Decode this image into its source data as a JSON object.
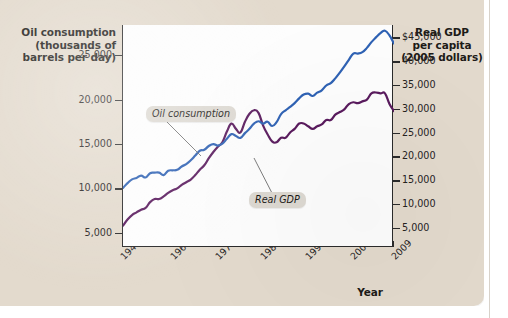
{
  "axis_titles": {
    "left": "Oil consumption\n(thousands of\nbarrels per day)",
    "left_line1": "Oil consumption",
    "left_line2": "(thousands of",
    "left_line3": "barrels per day)",
    "right_line1": "Real GDP",
    "right_line2": "per capita",
    "right_line3": "(2005 dollars)",
    "x": "Year"
  },
  "callouts": {
    "oil": "Oil consumption",
    "gdp": "Real GDP"
  },
  "colors": {
    "oil_line": "#5a1b5e",
    "gdp_line": "#2f62b4",
    "panel_background": "#e3dacd",
    "plot_background": "#fdfdfd",
    "axis": "#2b2b2b",
    "callout_background": "#ddd9d2"
  },
  "chart_data": {
    "type": "line",
    "title": "",
    "subtitle": "",
    "xlabel": "Year",
    "grid": false,
    "legend_position": "inline-callouts",
    "xlim": [
      1949,
      2009
    ],
    "x_ticks": [
      1949,
      1960,
      1970,
      1980,
      1990,
      2000,
      2009
    ],
    "x_tick_labels": [
      "1949",
      "1960",
      "1970",
      "1980",
      "1990",
      "2000",
      "2009"
    ],
    "axes": [
      {
        "id": "left",
        "side": "left",
        "ylabel": "Oil consumption (thousands of barrels per day)",
        "ylim": [
          3400,
          28400
        ],
        "ticks": [
          5000,
          10000,
          15000,
          20000,
          25000
        ],
        "tick_labels": [
          "5,000",
          "10,000",
          "15,000",
          "20,000",
          "25,000"
        ]
      },
      {
        "id": "right",
        "side": "right",
        "ylabel": "Real GDP per capita (2005 dollars)",
        "ylim": [
          1000,
          47600
        ],
        "ticks": [
          5000,
          10000,
          15000,
          20000,
          25000,
          30000,
          35000,
          40000,
          45000
        ],
        "tick_labels": [
          "5,000",
          "10,000",
          "15,000",
          "20,000",
          "25,000",
          "30,000",
          "35,000",
          "40,000",
          "$45,000"
        ]
      }
    ],
    "series": [
      {
        "name": "Oil consumption",
        "axis": "left",
        "color": "#5a1b5e",
        "units": "thousands of barrels per day",
        "x": [
          1949,
          1950,
          1951,
          1952,
          1953,
          1954,
          1955,
          1956,
          1957,
          1958,
          1959,
          1960,
          1961,
          1962,
          1963,
          1964,
          1965,
          1966,
          1967,
          1968,
          1969,
          1970,
          1971,
          1972,
          1973,
          1974,
          1975,
          1976,
          1977,
          1978,
          1979,
          1980,
          1981,
          1982,
          1983,
          1984,
          1985,
          1986,
          1987,
          1988,
          1989,
          1990,
          1991,
          1992,
          1993,
          1994,
          1995,
          1996,
          1997,
          1998,
          1999,
          2000,
          2001,
          2002,
          2003,
          2004,
          2005,
          2006,
          2007,
          2008,
          2009
        ],
        "values": [
          5800,
          6500,
          7000,
          7300,
          7600,
          7800,
          8450,
          8800,
          8800,
          9100,
          9500,
          9800,
          10000,
          10400,
          10700,
          11000,
          11500,
          12100,
          12600,
          13400,
          14100,
          14700,
          15200,
          16400,
          17300,
          16700,
          16300,
          17500,
          18400,
          18800,
          18500,
          17100,
          16100,
          15300,
          15200,
          15700,
          15700,
          16300,
          16700,
          17300,
          17300,
          17000,
          16700,
          17000,
          17200,
          17700,
          17700,
          18300,
          18600,
          18900,
          19500,
          19700,
          19600,
          19800,
          20000,
          20700,
          20800,
          20700,
          20700,
          19500,
          18700
        ]
      },
      {
        "name": "Real GDP",
        "axis": "right",
        "color": "#2f62b4",
        "units": "2005 dollars per capita",
        "x": [
          1949,
          1950,
          1951,
          1952,
          1953,
          1954,
          1955,
          1956,
          1957,
          1958,
          1959,
          1960,
          1961,
          1962,
          1963,
          1964,
          1965,
          1966,
          1967,
          1968,
          1969,
          1970,
          1971,
          1972,
          1973,
          1974,
          1975,
          1976,
          1977,
          1978,
          1979,
          1980,
          1981,
          1982,
          1983,
          1984,
          1985,
          1986,
          1987,
          1988,
          1989,
          1990,
          1991,
          1992,
          1993,
          1994,
          1995,
          1996,
          1997,
          1998,
          1999,
          2000,
          2001,
          2002,
          2003,
          2004,
          2005,
          2006,
          2007,
          2008,
          2009
        ],
        "values": [
          13400,
          14400,
          15200,
          15500,
          16000,
          15600,
          16500,
          16600,
          16600,
          16100,
          17000,
          17100,
          17200,
          17900,
          18400,
          19200,
          20200,
          21200,
          21400,
          22200,
          22600,
          22300,
          22700,
          23700,
          24700,
          24300,
          23900,
          24900,
          25800,
          26900,
          27400,
          26900,
          27300,
          26400,
          27200,
          28900,
          29700,
          30400,
          31200,
          32200,
          33000,
          33200,
          32700,
          33400,
          33900,
          34900,
          35400,
          36400,
          37600,
          38900,
          40300,
          41600,
          41600,
          41900,
          42800,
          44000,
          45000,
          45900,
          46400,
          45400,
          43700
        ]
      }
    ],
    "callout_annotations": [
      {
        "text": "Oil consumption",
        "points_to_series": "Oil consumption",
        "points_to_year": 1972
      },
      {
        "text": "Real GDP",
        "points_to_series": "Real GDP",
        "points_to_year": 1981
      }
    ]
  }
}
